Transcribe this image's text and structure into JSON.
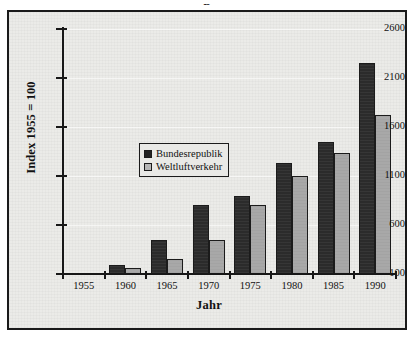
{
  "figure": {
    "background_color": "#ebebe8",
    "frame_color": "#1a1a1a",
    "top_artifact": "p"
  },
  "axes": {
    "ylabel": "Index 1955 = 100",
    "xlabel": "Jahr",
    "yticks": [
      "100",
      "600",
      "1100",
      "1600",
      "2100",
      "2600"
    ],
    "xticks": [
      "1955",
      "1960",
      "1965",
      "1970",
      "1975",
      "1980",
      "1985",
      "1990"
    ]
  },
  "legend": {
    "position": "upper-left-inside",
    "items": [
      {
        "label": "Bundesrepublik",
        "color": "#2b2b2b",
        "swatch": "dark"
      },
      {
        "label": "Weltluftverkehr",
        "color": "#a8a8a8",
        "swatch": "light"
      }
    ]
  },
  "chart_data": {
    "type": "bar",
    "title": "",
    "xlabel": "Jahr",
    "ylabel": "Index 1955 = 100",
    "categories": [
      "1955",
      "1960",
      "1965",
      "1970",
      "1975",
      "1980",
      "1985",
      "1990"
    ],
    "ylim": [
      100,
      2600
    ],
    "ytick_values": [
      100,
      600,
      1100,
      1600,
      2100,
      2600
    ],
    "grid": true,
    "legend_position": "upper-left-inside",
    "series": [
      {
        "name": "Bundesrepublik",
        "color": "#2b2b2b",
        "values": [
          null,
          190,
          450,
          800,
          900,
          1230,
          1450,
          2250
        ]
      },
      {
        "name": "Weltluftverkehr",
        "color": "#a8a8a8",
        "values": [
          null,
          160,
          250,
          450,
          800,
          1100,
          1330,
          1720
        ]
      }
    ]
  }
}
